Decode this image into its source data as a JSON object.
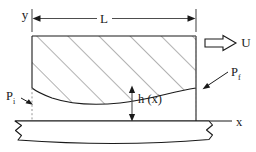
{
  "figure": {
    "type": "engineering-schematic",
    "labels": {
      "y_axis": "y",
      "x_axis": "x",
      "length": "L",
      "velocity": "U",
      "film_thickness": "h (x)",
      "pressure_inlet_base": "P",
      "pressure_inlet_sub": "i",
      "pressure_outlet_base": "P",
      "pressure_outlet_sub": "f"
    },
    "colors": {
      "line": "#1a1a1a",
      "hatch": "#555555",
      "dimension": "#4d4d4d",
      "background": "#ffffff"
    },
    "geometry": {
      "pad_left_x": 32,
      "pad_right_x": 196,
      "pad_top_y": 36,
      "dimension_line_y": 18,
      "substrate_top_y": 121,
      "x_axis_y": 121,
      "film_curve_left_y": 88,
      "film_curve_trough_y": 104,
      "film_curve_right_y": 88
    }
  }
}
